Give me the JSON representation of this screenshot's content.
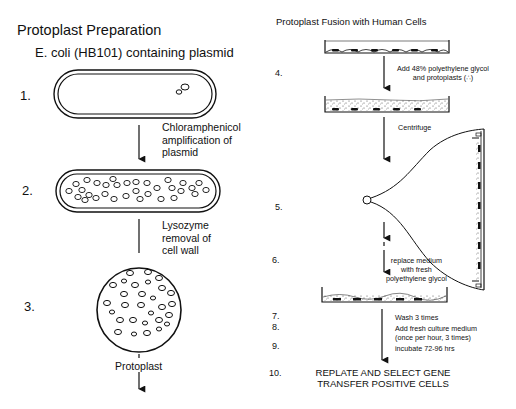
{
  "left_panel": {
    "title": "Protoplast Preparation",
    "subtitle": "E. coli (HB101) containing plasmid",
    "steps": [
      {
        "number": "1.",
        "stage": "bacterium-with-plasmid"
      },
      {
        "number": "2.",
        "stage": "bacterium-amplified-plasmids"
      },
      {
        "number": "3.",
        "stage": "protoplast"
      }
    ],
    "notes": {
      "amplification": [
        "Chloramphenicol",
        "amplification of",
        "plasmid"
      ],
      "lysozyme": [
        "Lysozyme",
        "removal of",
        "cell wall"
      ],
      "protoplast_label": "Protoplast"
    }
  },
  "right_panel": {
    "title": "Protoplast Fusion with Human Cells",
    "steps": [
      {
        "number": "4.",
        "note": [
          "Add 48% polyethylene glycol",
          "and protoplasts (∴)"
        ]
      },
      {
        "number": "5.",
        "note": [
          "Centrifuge"
        ]
      },
      {
        "number": "6.",
        "note": [
          "replace medium",
          "with fresh",
          "polyethylene glycol"
        ]
      },
      {
        "number": "7.",
        "note": [
          "Wash 3 times"
        ]
      },
      {
        "number": "8.",
        "note": [
          "Add fresh culture medium",
          "(once per hour, 3 times)"
        ]
      },
      {
        "number": "9.",
        "note": [
          "incubate 72-96 hrs"
        ]
      },
      {
        "number": "10.",
        "note": [
          "REPLATE AND SELECT GENE",
          "TRANSFER POSITIVE CELLS"
        ]
      }
    ]
  },
  "colors": {
    "ink": "#111111",
    "background": "#ffffff"
  }
}
